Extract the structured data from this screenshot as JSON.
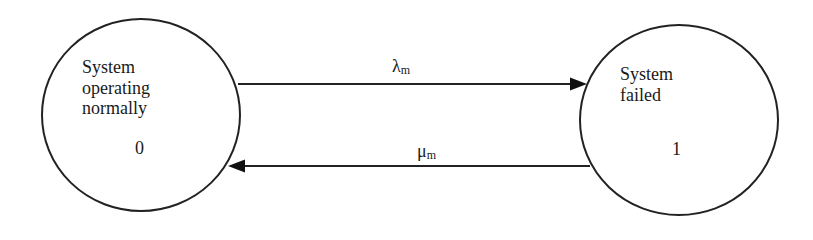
{
  "diagram": {
    "type": "markov-state-transition",
    "states": [
      {
        "id": 0,
        "lines": [
          "System",
          "operating",
          "normally"
        ],
        "number": "0"
      },
      {
        "id": 1,
        "lines": [
          "System",
          "failed"
        ],
        "number": "1"
      }
    ],
    "transitions": [
      {
        "from": 0,
        "to": 1,
        "symbol": "λ",
        "subscript": "m"
      },
      {
        "from": 1,
        "to": 0,
        "symbol": "μ",
        "subscript": "m"
      }
    ],
    "colors": {
      "stroke": "#222222",
      "text": "#1a1a1a",
      "background": "#ffffff"
    }
  }
}
